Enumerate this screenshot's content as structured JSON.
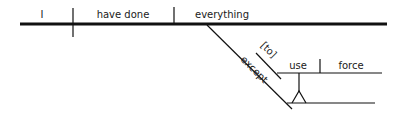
{
  "diagram": {
    "type": "sentence-diagram",
    "sentence": "I have done everything except [to] use force",
    "ink_color": "#111111",
    "background": "#ffffff",
    "words": {
      "subject": "I",
      "verb": "have done",
      "object": "everything",
      "preposition": "except",
      "infinitive_marker": "[to]",
      "infinitive_verb": "use",
      "infinitive_object": "force"
    }
  }
}
